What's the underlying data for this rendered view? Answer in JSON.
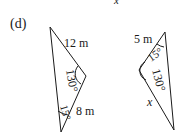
{
  "part_label": "(d)",
  "top_fragment": "x",
  "triangle_left": {
    "side_top": "12 m",
    "side_bottom": "8 m",
    "angle_right": "130°",
    "angle_bottom": "15°"
  },
  "triangle_right": {
    "side_top": "5 m",
    "side_bottom": "x",
    "angle_top": "15°",
    "angle_left": "130°"
  },
  "colors": {
    "stroke": "#1a1a1a",
    "background": "#ffffff"
  }
}
